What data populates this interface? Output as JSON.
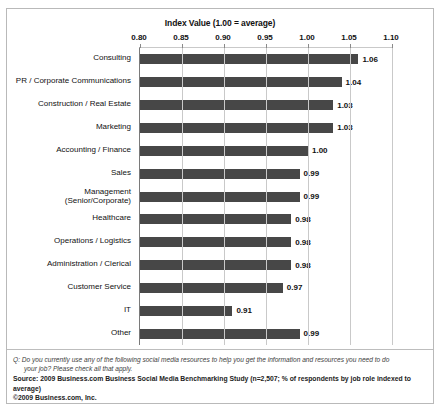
{
  "chart_data": {
    "type": "bar",
    "orientation": "horizontal",
    "title": "Index Value (1.00 = average)",
    "xlabel": "",
    "ylabel": "",
    "xlim": [
      0.8,
      1.1
    ],
    "xticks": [
      "0.80",
      "0.85",
      "0.90",
      "0.95",
      "1.00",
      "1.05",
      "1.10"
    ],
    "xtick_values": [
      0.8,
      0.85,
      0.9,
      0.95,
      1.0,
      1.05,
      1.1
    ],
    "grid": true,
    "legend": false,
    "bar_color": "#474747",
    "categories": [
      "Consulting",
      "PR / Corporate Communications",
      "Construction / Real Estate",
      "Marketing",
      "Accounting / Finance",
      "Sales",
      "Management\n(Senior/Corporate)",
      "Healthcare",
      "Operations / Logistics",
      "Administration / Clerical",
      "Customer Service",
      "IT",
      "Other"
    ],
    "values": [
      1.06,
      1.04,
      1.03,
      1.03,
      1.0,
      0.99,
      0.99,
      0.98,
      0.98,
      0.98,
      0.97,
      0.91,
      0.99
    ],
    "value_labels": [
      "1.06",
      "1.04",
      "1.03",
      "1.03",
      "1.00",
      "0.99",
      "0.99",
      "0.98",
      "0.98",
      "0.98",
      "0.97",
      "0.91",
      "0.99"
    ]
  },
  "category_rows": [
    {
      "line1": "Consulting",
      "line2": "",
      "value_label": "1.06"
    },
    {
      "line1": "PR / Corporate Communications",
      "line2": "",
      "value_label": "1.04"
    },
    {
      "line1": "Construction / Real Estate",
      "line2": "",
      "value_label": "1.03"
    },
    {
      "line1": "Marketing",
      "line2": "",
      "value_label": "1.03"
    },
    {
      "line1": "Accounting / Finance",
      "line2": "",
      "value_label": "1.00"
    },
    {
      "line1": "Sales",
      "line2": "",
      "value_label": "0.99"
    },
    {
      "line1": "Management",
      "line2": "(Senior/Corporate)",
      "value_label": "0.99"
    },
    {
      "line1": "Healthcare",
      "line2": "",
      "value_label": "0.98"
    },
    {
      "line1": "Operations / Logistics",
      "line2": "",
      "value_label": "0.98"
    },
    {
      "line1": "Administration / Clerical",
      "line2": "",
      "value_label": "0.98"
    },
    {
      "line1": "Customer Service",
      "line2": "",
      "value_label": "0.97"
    },
    {
      "line1": "IT",
      "line2": "",
      "value_label": "0.91"
    },
    {
      "line1": "Other",
      "line2": "",
      "value_label": "0.99"
    }
  ],
  "footnote": {
    "question_line1": "Q: Do you currently use any of the following social media resources to help you get the information and resources you need to do",
    "question_line2": "your job? Please check all that apply.",
    "source": "Source: 2009 Business.com Business Social Media Benchmarking Study (n=2,507; % of respondents by job role indexed to average)",
    "copyright": "©2009 Business.com, Inc."
  }
}
